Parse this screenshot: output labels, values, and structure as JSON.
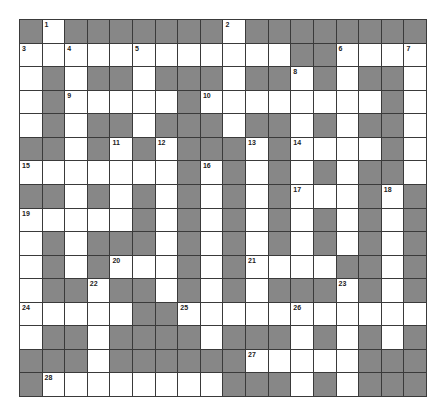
{
  "puzzle": {
    "rows": 16,
    "cols": 18,
    "colors": {
      "block": "#878787",
      "open": "#ffffff",
      "line": "#3a3a3a"
    },
    "layout": [
      "#.#######.########",
      "............##....",
      ".#.##.###.##.#.##.",
      ".#.....#........#.",
      ".#.##.###.##.#.##.",
      "##.#.#.###.#....#.",
      ".......#.#.#.#.##.",
      "##.#.#.#.#.#...#.#",
      ".....#.#.#.#.#.#.#",
      ".#.###.#.#.#.#.#.#",
      ".#.#...#.#....##.#",
      ".##.##.#.#.###.#.#",
      ".....##...........",
      ".##.####.###.#.#.#",
      "###.######.....###",
      "#........###.#.###"
    ],
    "numbers": [
      {
        "r": 0,
        "c": 1,
        "n": "1"
      },
      {
        "r": 0,
        "c": 9,
        "n": "2"
      },
      {
        "r": 1,
        "c": 0,
        "n": "3"
      },
      {
        "r": 1,
        "c": 2,
        "n": "4"
      },
      {
        "r": 1,
        "c": 5,
        "n": "5"
      },
      {
        "r": 1,
        "c": 14,
        "n": "6"
      },
      {
        "r": 1,
        "c": 17,
        "n": "7"
      },
      {
        "r": 2,
        "c": 12,
        "n": "8"
      },
      {
        "r": 3,
        "c": 2,
        "n": "9"
      },
      {
        "r": 3,
        "c": 8,
        "n": "10"
      },
      {
        "r": 5,
        "c": 4,
        "n": "11"
      },
      {
        "r": 5,
        "c": 6,
        "n": "12"
      },
      {
        "r": 5,
        "c": 10,
        "n": "13"
      },
      {
        "r": 5,
        "c": 12,
        "n": "14"
      },
      {
        "r": 6,
        "c": 0,
        "n": "15"
      },
      {
        "r": 6,
        "c": 8,
        "n": "16"
      },
      {
        "r": 7,
        "c": 12,
        "n": "17"
      },
      {
        "r": 7,
        "c": 16,
        "n": "18"
      },
      {
        "r": 8,
        "c": 0,
        "n": "19"
      },
      {
        "r": 10,
        "c": 4,
        "n": "20"
      },
      {
        "r": 10,
        "c": 10,
        "n": "21"
      },
      {
        "r": 11,
        "c": 3,
        "n": "22"
      },
      {
        "r": 11,
        "c": 14,
        "n": "23"
      },
      {
        "r": 12,
        "c": 0,
        "n": "24"
      },
      {
        "r": 12,
        "c": 7,
        "n": "25"
      },
      {
        "r": 12,
        "c": 12,
        "n": "26"
      },
      {
        "r": 14,
        "c": 10,
        "n": "27"
      },
      {
        "r": 15,
        "c": 1,
        "n": "28"
      }
    ]
  }
}
